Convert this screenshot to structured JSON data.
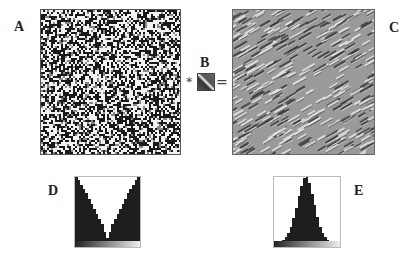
{
  "figure": {
    "panels": {
      "A": {
        "label": "A",
        "description": "random binary noise image"
      },
      "B": {
        "label": "B",
        "description": "small oriented filter kernel"
      },
      "C": {
        "label": "C",
        "description": "filtered texture with diagonal orientation"
      },
      "D": {
        "label": "D",
        "description": "histogram of A (bimodal)"
      },
      "E": {
        "label": "E",
        "description": "histogram of C (unimodal)"
      }
    },
    "operators": {
      "convolve": "*",
      "equals": "="
    }
  },
  "chart_data": [
    {
      "type": "bar",
      "title": "D",
      "categories": [
        "1",
        "2",
        "3",
        "4",
        "5",
        "6",
        "7",
        "8",
        "9",
        "10",
        "11",
        "12",
        "13",
        "14",
        "15",
        "16",
        "17",
        "18",
        "19",
        "20",
        "21",
        "22",
        "23",
        "24",
        "25"
      ],
      "values": [
        100,
        95,
        88,
        82,
        75,
        66,
        58,
        50,
        42,
        34,
        26,
        14,
        4,
        14,
        26,
        34,
        42,
        50,
        58,
        66,
        75,
        82,
        88,
        95,
        100
      ],
      "xlabel": "",
      "ylabel": "",
      "ylim": [
        0,
        100
      ]
    },
    {
      "type": "bar",
      "title": "E",
      "categories": [
        "1",
        "2",
        "3",
        "4",
        "5",
        "6",
        "7",
        "8",
        "9",
        "10",
        "11",
        "12",
        "13",
        "14",
        "15",
        "16",
        "17",
        "18",
        "19",
        "20",
        "21",
        "22",
        "23",
        "24",
        "25"
      ],
      "values": [
        0,
        0,
        0,
        2,
        6,
        12,
        22,
        36,
        52,
        70,
        86,
        98,
        100,
        90,
        74,
        56,
        38,
        22,
        12,
        6,
        2,
        0,
        0,
        0,
        0
      ],
      "xlabel": "",
      "ylabel": "",
      "ylim": [
        0,
        100
      ]
    }
  ]
}
